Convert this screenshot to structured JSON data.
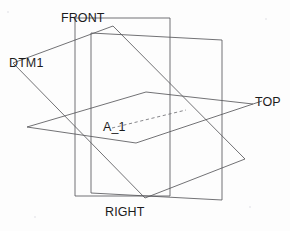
{
  "drawing": {
    "title": "Datum Plane Reference Geometry",
    "width": 290,
    "height": 231,
    "background_color": "#fdfdfd",
    "line_color": "#58585c",
    "text_color": "#1c1c1c"
  },
  "labels": {
    "front": "FRONT",
    "dtm1": "DTM1",
    "top": "TOP",
    "axis": "A_1",
    "right": "RIGHT"
  },
  "geometry": {
    "front_plane": {
      "name": "FRONT",
      "type": "vertical-rectangle",
      "points": "75,18 75,196 170,196 170,18"
    },
    "right_plane": {
      "name": "RIGHT",
      "type": "vertical-parallelogram",
      "points": "91,33 222,40 222,200 91,193"
    },
    "top_plane": {
      "name": "TOP",
      "type": "horizontal-parallelogram",
      "points": "27,127 146,92 253,104 136,143"
    },
    "dtm1_plane": {
      "name": "DTM1",
      "type": "tilted-parallelogram",
      "points": "13,63 113,26 245,159 145,198"
    },
    "axis_a1": {
      "name": "A_1",
      "type": "dashed-line",
      "from": "112,128",
      "to": "186,110"
    },
    "leaders": [
      {
        "name": "dtm1-leader",
        "path": "13,63 113,26"
      },
      {
        "name": "top-leader",
        "path": "253,104 27,127"
      }
    ]
  },
  "icons": {
    "datum_plane": "datum-plane-icon",
    "axis": "axis-icon"
  }
}
